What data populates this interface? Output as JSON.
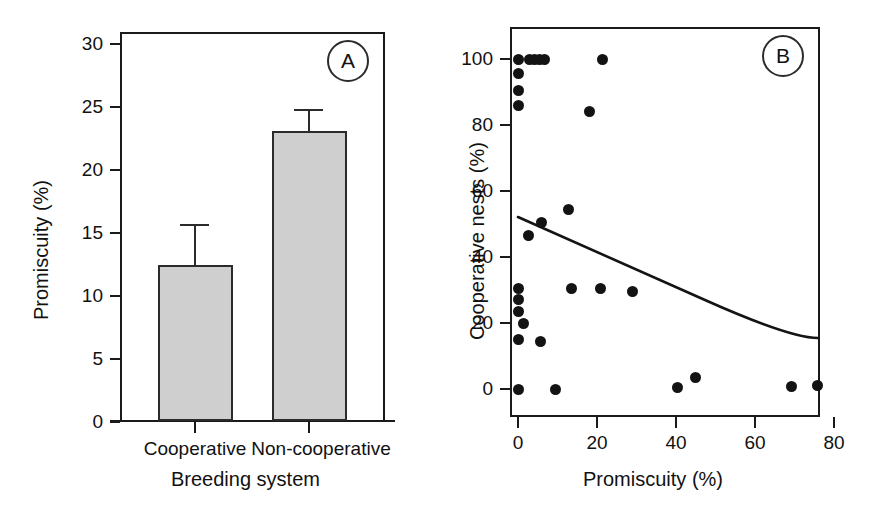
{
  "figure": {
    "panels": [
      "A",
      "B"
    ]
  },
  "panel_a": {
    "badge": "A",
    "ylabel": "Promiscuity (%)",
    "xlabel": "Breeding system",
    "yticks": [
      "0",
      "5",
      "10",
      "15",
      "20",
      "25",
      "30"
    ],
    "categories": [
      "Cooperative",
      "Non-cooperative"
    ]
  },
  "panel_b": {
    "badge": "B",
    "ylabel": "Cooperative nests (%)",
    "xlabel": "Promiscuity (%)",
    "yticks": [
      "0",
      "20",
      "40",
      "60",
      "80",
      "100"
    ],
    "xticks": [
      "0",
      "20",
      "40",
      "60",
      "80"
    ]
  },
  "colors": {
    "bar_fill": "#cfcfcf",
    "bar_stroke": "#2b2b2b",
    "axis": "#1a1a1a",
    "dot": "#131313",
    "curve": "#141414",
    "background": "#ffffff"
  },
  "chart_data": [
    {
      "type": "bar",
      "panel": "A",
      "title": "",
      "xlabel": "Breeding system",
      "ylabel": "Promiscuity (%)",
      "categories": [
        "Cooperative",
        "Non-cooperative"
      ],
      "values": [
        12.4,
        23.1
      ],
      "errors_upper": [
        3.2,
        1.7
      ],
      "error_type": "SE (upper only shown)",
      "ylim": [
        0,
        31
      ],
      "yticks": [
        0,
        5,
        10,
        15,
        20,
        25,
        30
      ],
      "grid": false,
      "legend": "none"
    },
    {
      "type": "scatter",
      "panel": "B",
      "title": "",
      "xlabel": "Promiscuity (%)",
      "ylabel": "Cooperative nests (%)",
      "xlim": [
        -4,
        86
      ],
      "ylim": [
        -7,
        108
      ],
      "xticks": [
        0,
        20,
        40,
        60,
        80
      ],
      "yticks": [
        0,
        20,
        40,
        60,
        80,
        100
      ],
      "grid": false,
      "legend": "none",
      "points": [
        {
          "x": 0.0,
          "y": 100.0
        },
        {
          "x": 3.0,
          "y": 100.0
        },
        {
          "x": 4.3,
          "y": 100.0
        },
        {
          "x": 5.5,
          "y": 100.0
        },
        {
          "x": 6.8,
          "y": 100.0
        },
        {
          "x": 21.3,
          "y": 100.0
        },
        {
          "x": 0.0,
          "y": 95.5
        },
        {
          "x": 0.0,
          "y": 90.5
        },
        {
          "x": 0.0,
          "y": 86.0
        },
        {
          "x": 18.0,
          "y": 84.0
        },
        {
          "x": 12.8,
          "y": 54.5
        },
        {
          "x": 6.0,
          "y": 50.5
        },
        {
          "x": 2.6,
          "y": 46.5
        },
        {
          "x": 0.0,
          "y": 30.5
        },
        {
          "x": 13.5,
          "y": 30.5
        },
        {
          "x": 21.0,
          "y": 30.5
        },
        {
          "x": 29.0,
          "y": 29.5
        },
        {
          "x": 0.0,
          "y": 27.0
        },
        {
          "x": 0.0,
          "y": 23.5
        },
        {
          "x": 1.5,
          "y": 20.0
        },
        {
          "x": 0.0,
          "y": 15.0
        },
        {
          "x": 5.8,
          "y": 14.5
        },
        {
          "x": 0.0,
          "y": 0.0
        },
        {
          "x": 9.5,
          "y": 0.0
        },
        {
          "x": 40.3,
          "y": 0.5
        },
        {
          "x": 45.0,
          "y": 3.5
        },
        {
          "x": 69.3,
          "y": 0.8
        },
        {
          "x": 75.8,
          "y": 1.0
        }
      ],
      "fit_curve": {
        "label": "fitted decline",
        "x_start": 0.0,
        "x_end": 76.0,
        "y_start": 52.0,
        "y_end": 15.3,
        "shape": "exponential-decay"
      }
    }
  ]
}
